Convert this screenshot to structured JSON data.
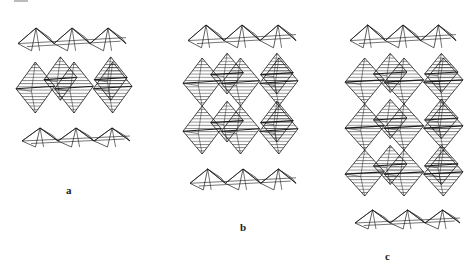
{
  "figure": {
    "panels": [
      {
        "id": "a",
        "label": "a",
        "octahedral_rows": 1
      },
      {
        "id": "b",
        "label": "b",
        "octahedral_rows": 2
      },
      {
        "id": "c",
        "label": "c",
        "octahedral_rows": 3
      }
    ]
  },
  "colors": {
    "background": "#ffffff",
    "stroke": "#1a1a1a",
    "hatch": "#2a2a2a"
  }
}
